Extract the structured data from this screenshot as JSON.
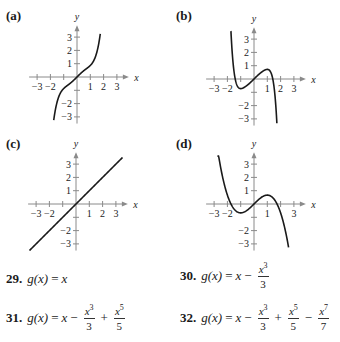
{
  "panels": [
    {
      "id": "a",
      "label": "(a)",
      "left": 0,
      "top": 0,
      "origin": [
        77,
        77
      ],
      "unit": 13.3,
      "xticks": [
        "−3",
        "−2",
        "",
        "1",
        "2",
        "3"
      ],
      "xtick_values": [
        -3,
        -2,
        -1,
        1,
        2,
        3
      ],
      "yticks": [
        "3",
        "2",
        "1",
        "",
        "−2",
        "−3"
      ],
      "ytick_values": [
        3,
        2,
        1,
        -1,
        -2,
        -3
      ],
      "coeffs": [
        0,
        1,
        0,
        -0.3333,
        0,
        0.2,
        0,
        0
      ],
      "xrange": [
        -1.75,
        1.75
      ]
    },
    {
      "id": "b",
      "label": "(b)",
      "left": 170,
      "top": 0,
      "origin": [
        84,
        79
      ],
      "unit": 13.3,
      "xticks": [
        "−3",
        "−2",
        "",
        "1",
        "2",
        "3"
      ],
      "xtick_values": [
        -3,
        -2,
        -1,
        1,
        2,
        3
      ],
      "yticks": [
        "3",
        "2",
        "1",
        "",
        "−2",
        "−3"
      ],
      "ytick_values": [
        3,
        2,
        1,
        -1,
        -2,
        -3
      ],
      "coeffs": [
        0,
        1,
        0,
        -0.3333,
        0,
        0.2,
        0,
        -0.142857
      ],
      "xrange": [
        -1.75,
        1.72
      ]
    },
    {
      "id": "c",
      "label": "(c)",
      "left": 0,
      "top": 128,
      "origin": [
        76,
        76
      ],
      "unit": 13.3,
      "xticks": [
        "−3",
        "−2",
        "",
        "1",
        "2",
        "3"
      ],
      "xtick_values": [
        -3,
        -2,
        -1,
        1,
        2,
        3
      ],
      "yticks": [
        "3",
        "2",
        "1",
        "",
        "−2",
        "−3"
      ],
      "ytick_values": [
        3,
        2,
        1,
        -1,
        -2,
        -3
      ],
      "coeffs": [
        0,
        1,
        0,
        0,
        0,
        0,
        0,
        0
      ],
      "xrange": [
        -3.5,
        3.5
      ]
    },
    {
      "id": "d",
      "label": "(d)",
      "left": 170,
      "top": 128,
      "origin": [
        84,
        76
      ],
      "unit": 13.3,
      "xticks": [
        "−3",
        "−2",
        "",
        "1",
        "",
        "3"
      ],
      "xtick_values": [
        -3,
        -2,
        -1,
        1,
        2,
        3
      ],
      "yticks": [
        "3",
        "2",
        "1",
        "",
        "−2",
        "−3"
      ],
      "ytick_values": [
        3,
        2,
        1,
        -1,
        -2,
        -3
      ],
      "coeffs": [
        0,
        1,
        0,
        -0.3333,
        0,
        0,
        0,
        0
      ],
      "xrange": [
        -2.75,
        2.6
      ]
    }
  ],
  "axis_labels": {
    "x": "x",
    "y": "y"
  },
  "colors": {
    "axis": "#8a8a8a",
    "curve": "#1a1a1a",
    "text": "#1a1a1a"
  },
  "exercises": [
    {
      "num": "29.",
      "lhs": "g(x)",
      "eq": "=",
      "rhs_lead": "x"
    },
    {
      "num": "30.",
      "lhs": "g(x)",
      "eq": "=",
      "rhs_lead": "x",
      "terms": [
        {
          "op": "−",
          "n": "x",
          "p": "3",
          "d": "3"
        }
      ]
    },
    {
      "num": "31.",
      "lhs": "g(x)",
      "eq": "=",
      "rhs_lead": "x",
      "terms": [
        {
          "op": "−",
          "n": "x",
          "p": "3",
          "d": "3"
        },
        {
          "op": "+",
          "n": "x",
          "p": "5",
          "d": "5"
        }
      ]
    },
    {
      "num": "32.",
      "lhs": "g(x)",
      "eq": "=",
      "rhs_lead": "x",
      "terms": [
        {
          "op": "−",
          "n": "x",
          "p": "3",
          "d": "3"
        },
        {
          "op": "+",
          "n": "x",
          "p": "5",
          "d": "5"
        },
        {
          "op": "−",
          "n": "x",
          "p": "7",
          "d": "7"
        }
      ]
    }
  ]
}
